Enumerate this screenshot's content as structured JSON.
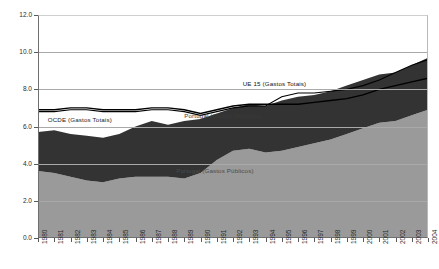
{
  "chart_data": {
    "type": "area",
    "title": "",
    "subtitle": "",
    "xlabel": "",
    "ylabel": "",
    "stacked": true,
    "grid": true,
    "legend_position": "inline-annotations",
    "xlim": [
      1980,
      2004
    ],
    "ylim": [
      0.0,
      12.0
    ],
    "ytick_step": 2.0,
    "x": [
      1980,
      1981,
      1982,
      1983,
      1984,
      1985,
      1986,
      1987,
      1988,
      1989,
      1990,
      1991,
      1992,
      1993,
      1994,
      1995,
      1996,
      1997,
      1998,
      1999,
      2000,
      2001,
      2002,
      2003,
      2004
    ],
    "xtick_labels": [
      "1980",
      "1981",
      "1982",
      "1983",
      "1984",
      "1985",
      "1986",
      "1987",
      "1988",
      "1989",
      "1990",
      "1991",
      "1992",
      "1993",
      "1994",
      "1995",
      "1996",
      "1997",
      "1998",
      "1999",
      "2000",
      "2001",
      "2002",
      "2003",
      "2004"
    ],
    "ytick_labels": [
      "0.0",
      "2.0",
      "4.0",
      "6.0",
      "8.0",
      "10.0",
      "12.0"
    ],
    "ytick_values": [
      0.0,
      2.0,
      4.0,
      6.0,
      8.0,
      10.0,
      12.0
    ],
    "series": [
      {
        "name": "Portugal (Gastos Públicos)",
        "kind": "area",
        "color": "#9a9a9a",
        "stack_order": 1,
        "values": [
          3.6,
          3.5,
          3.3,
          3.1,
          3.0,
          3.2,
          3.3,
          3.3,
          3.3,
          3.2,
          3.5,
          4.2,
          4.7,
          4.8,
          4.6,
          4.7,
          4.9,
          5.1,
          5.3,
          5.6,
          5.9,
          6.2,
          6.3,
          6.6,
          6.9
        ]
      },
      {
        "name": "Portugal (Gastos Privados)",
        "kind": "area",
        "color": "#333333",
        "stack_order": 2,
        "values": [
          2.1,
          2.3,
          2.3,
          2.4,
          2.4,
          2.4,
          2.7,
          3.0,
          2.8,
          3.1,
          2.9,
          2.5,
          2.3,
          2.4,
          2.5,
          2.7,
          2.7,
          2.6,
          2.6,
          2.6,
          2.6,
          2.6,
          2.6,
          2.7,
          2.8
        ]
      },
      {
        "name": "OCDE (Gastos Totais)",
        "kind": "line",
        "color": "#000000",
        "values": [
          6.9,
          6.9,
          7.0,
          7.0,
          6.9,
          6.9,
          6.9,
          7.0,
          7.0,
          6.9,
          6.7,
          6.9,
          7.1,
          7.2,
          7.2,
          7.2,
          7.2,
          7.3,
          7.4,
          7.5,
          7.7,
          8.0,
          8.2,
          8.4,
          8.6
        ]
      },
      {
        "name": "UE 15 (Gastos Totais)",
        "kind": "line",
        "color": "#000000",
        "values": [
          6.8,
          6.8,
          6.9,
          6.9,
          6.8,
          6.8,
          6.8,
          6.9,
          6.9,
          6.8,
          6.6,
          6.8,
          7.0,
          7.1,
          7.1,
          7.6,
          7.8,
          7.8,
          7.9,
          8.0,
          8.2,
          8.5,
          8.9,
          9.3,
          9.6
        ]
      }
    ],
    "annotations": [
      {
        "id": "ue15",
        "text": "UE 15 (Gastos Totais)",
        "x": 1992.6,
        "y": 8.3
      },
      {
        "id": "ocde",
        "text": "OCDE (Gastos Totais)",
        "x": 1980.6,
        "y": 6.35
      },
      {
        "id": "privados",
        "text": "Portugal (Gastos Privados)",
        "x": 1989.0,
        "y": 6.55
      },
      {
        "id": "publicos",
        "text": "Portugal (Gastos Públicos)",
        "x": 1988.5,
        "y": 3.6
      }
    ],
    "colors": {
      "publicos": "#9a9a9a",
      "privados": "#333333",
      "line": "#000000",
      "grid": "#a9a9a9",
      "axis": "#6f6f6f",
      "background": "#ffffff"
    }
  }
}
